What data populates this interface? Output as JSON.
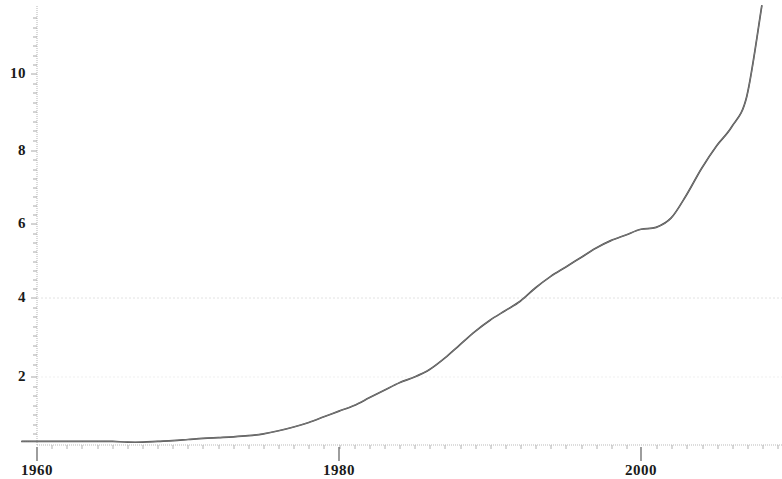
{
  "chart_data": {
    "type": "line",
    "title": "",
    "subtitle": "",
    "xlabel": "",
    "ylabel": "",
    "xlim": [
      1958.5,
      2009.0
    ],
    "ylim": [
      0.0,
      12.1
    ],
    "grid": "faint horizontal gridlines at y = 2 and y = 4",
    "legend": "none",
    "x_tick_labels": [
      "1960",
      "1980",
      "2000"
    ],
    "x_tick_values": [
      1960,
      1980,
      2000
    ],
    "y_tick_labels": [
      "2",
      "4",
      "6",
      "8",
      "10"
    ],
    "y_tick_values": [
      2,
      4,
      6,
      8,
      10
    ],
    "series": [
      {
        "name": "series-1",
        "color": "#4a4a4a",
        "x": [
          1959,
          1960,
          1961,
          1962,
          1963,
          1964,
          1965,
          1966,
          1967,
          1968,
          1969,
          1970,
          1971,
          1972,
          1973,
          1974,
          1975,
          1976,
          1977,
          1978,
          1979,
          1980,
          1981,
          1982,
          1983,
          1984,
          1985,
          1986,
          1987,
          1988,
          1989,
          1990,
          1991,
          1992,
          1993,
          1994,
          1995,
          1996,
          1997,
          1998,
          1999,
          2000,
          2001,
          2002,
          2003,
          2004,
          2005,
          2006,
          2007,
          2008
        ],
        "values": [
          0.3,
          0.3,
          0.3,
          0.3,
          0.3,
          0.3,
          0.3,
          0.28,
          0.28,
          0.3,
          0.32,
          0.35,
          0.38,
          0.4,
          0.42,
          0.45,
          0.5,
          0.58,
          0.68,
          0.8,
          0.95,
          1.1,
          1.25,
          1.45,
          1.65,
          1.85,
          2.0,
          2.2,
          2.5,
          2.85,
          3.2,
          3.5,
          3.75,
          4.0,
          4.35,
          4.65,
          4.9,
          5.15,
          5.4,
          5.6,
          5.75,
          5.9,
          5.95,
          6.2,
          6.8,
          7.5,
          8.1,
          8.6,
          9.4,
          11.8
        ]
      }
    ]
  },
  "axes": {
    "y_axis_name": "y-axis",
    "x_axis_name": "x-axis"
  }
}
